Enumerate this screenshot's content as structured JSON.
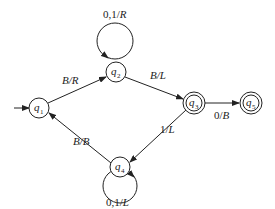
{
  "diagram": {
    "type": "turing-machine-state-diagram",
    "start_state": "q1",
    "states": [
      {
        "id": "q1",
        "name": "q",
        "sub": "1",
        "accepting": false
      },
      {
        "id": "q2",
        "name": "q",
        "sub": "2",
        "accepting": false
      },
      {
        "id": "q3",
        "name": "q",
        "sub": "3",
        "accepting": true
      },
      {
        "id": "q4",
        "name": "q",
        "sub": "4",
        "accepting": false
      },
      {
        "id": "q5",
        "name": "q",
        "sub": "5",
        "accepting": true
      }
    ],
    "transitions": [
      {
        "from": "q1",
        "to": "q2",
        "label": "B/R"
      },
      {
        "from": "q2",
        "to": "q2",
        "label": "0,1/R"
      },
      {
        "from": "q2",
        "to": "q3",
        "label": "B/L"
      },
      {
        "from": "q3",
        "to": "q5",
        "label": "0/B"
      },
      {
        "from": "q3",
        "to": "q4",
        "label": "1/L"
      },
      {
        "from": "q4",
        "to": "q4",
        "label": "0,1/L"
      },
      {
        "from": "q4",
        "to": "q1",
        "label": "B/B"
      }
    ]
  }
}
